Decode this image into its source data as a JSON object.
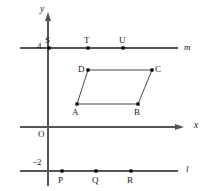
{
  "figure": {
    "type": "coordinate-geometry-diagram",
    "background_color": "#ffffff",
    "line_color": "#555555",
    "axis_color": "#555555",
    "shape_color": "#333333",
    "point_color": "#000000",
    "text_color": "#1a1a1a",
    "axes": {
      "y_axis": {
        "label": "y",
        "x_px": 48,
        "top_px": 16,
        "bottom_px": 186,
        "arrow": "up"
      },
      "x_axis": {
        "label": "x",
        "y_px": 127,
        "left_px": 20,
        "right_px": 180,
        "arrow": "right"
      },
      "origin_label": "O"
    },
    "tick_labels": [
      {
        "name": "y-tick-4",
        "text": "4",
        "value": 4,
        "x_px": 37,
        "y_px": 42
      },
      {
        "name": "y-tick-minus-2",
        "text": "−2",
        "value": -2,
        "x_px": 32,
        "y_px": 158
      }
    ],
    "horizontal_lines": [
      {
        "name": "line-m",
        "label": "m",
        "y_px": 48,
        "y_value": 4,
        "left_px": 20,
        "right_px": 178,
        "label_x_px": 184,
        "label_y_px": 43
      },
      {
        "name": "line-l",
        "label": "l",
        "y_px": 171,
        "y_value": -2,
        "left_px": 20,
        "right_px": 178,
        "label_x_px": 186,
        "label_y_px": 165
      }
    ],
    "points_on_m": [
      {
        "label": "S",
        "x_px": 49,
        "y_px": 48,
        "label_x_px": 45,
        "label_y_px": 36
      },
      {
        "label": "T",
        "x_px": 88,
        "y_px": 48,
        "label_x_px": 84,
        "label_y_px": 36
      },
      {
        "label": "U",
        "x_px": 123,
        "y_px": 48,
        "label_x_px": 119,
        "label_y_px": 36
      }
    ],
    "points_on_l": [
      {
        "label": "P",
        "x_px": 62,
        "y_px": 171,
        "label_x_px": 58,
        "label_y_px": 176
      },
      {
        "label": "Q",
        "x_px": 96,
        "y_px": 171,
        "label_x_px": 92,
        "label_y_px": 176
      },
      {
        "label": "R",
        "x_px": 131,
        "y_px": 171,
        "label_x_px": 127,
        "label_y_px": 176
      }
    ],
    "parallelogram": {
      "name": "parallelogram-ABCD",
      "vertices": [
        {
          "label": "A",
          "x_px": 77,
          "y_px": 104,
          "label_x_px": 72,
          "label_y_px": 108
        },
        {
          "label": "B",
          "x_px": 138,
          "y_px": 104,
          "label_x_px": 134,
          "label_y_px": 108
        },
        {
          "label": "C",
          "x_px": 152,
          "y_px": 70,
          "label_x_px": 155,
          "label_y_px": 65
        },
        {
          "label": "D",
          "x_px": 88,
          "y_px": 70,
          "label_x_px": 78,
          "label_y_px": 65
        }
      ]
    }
  }
}
